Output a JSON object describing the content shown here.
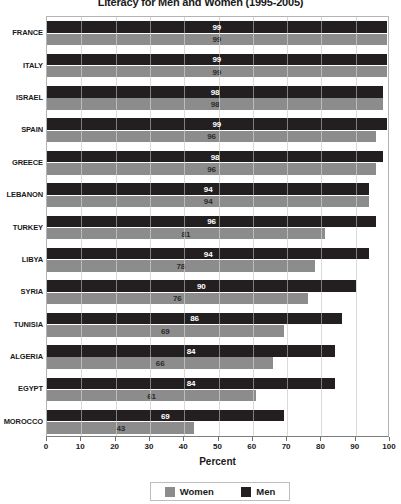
{
  "chart_data": {
    "type": "bar",
    "orientation": "horizontal",
    "title": "Literacy for Men and Women (1995-2005)",
    "xlabel": "Percent",
    "ylabel": "",
    "xlim": [
      0,
      100
    ],
    "xticks": [
      0,
      10,
      20,
      30,
      40,
      50,
      60,
      70,
      80,
      90,
      100
    ],
    "grid": true,
    "grid_axis": "x",
    "legend_position": "bottom",
    "categories": [
      "FRANCE",
      "ITALY",
      "ISRAEL",
      "SPAIN",
      "GREECE",
      "LEBANON",
      "TURKEY",
      "LIBYA",
      "SYRIA",
      "TUNISIA",
      "ALGERIA",
      "EGYPT",
      "MOROCCO"
    ],
    "series": [
      {
        "name": "Men",
        "color": "#231f20",
        "values": [
          99,
          99,
          98,
          99,
          98,
          94,
          96,
          94,
          90,
          86,
          84,
          84,
          69
        ]
      },
      {
        "name": "Women",
        "color": "#8c8c8c",
        "values": [
          99,
          99,
          98,
          96,
          96,
          94,
          81,
          78,
          76,
          69,
          66,
          61,
          43
        ]
      }
    ]
  },
  "legend": {
    "items": [
      {
        "label": "Women",
        "swatch": "women"
      },
      {
        "label": "Men",
        "swatch": "men"
      }
    ]
  },
  "colors": {
    "men": "#231f20",
    "women": "#8c8c8c",
    "grid": "#c0c0c0",
    "axis": "#7d7d7d",
    "text": "#1a1a1a"
  }
}
